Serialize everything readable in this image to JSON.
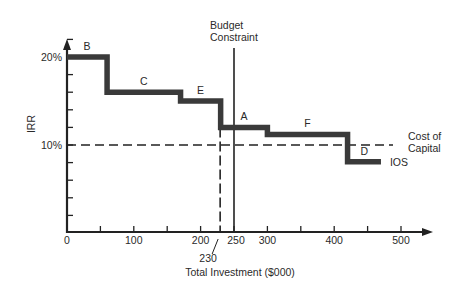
{
  "chart_data": {
    "type": "line",
    "title": "",
    "xlabel": "Total Investment ($000)",
    "ylabel": "IRR",
    "xlim": [
      0,
      550
    ],
    "ylim": [
      0,
      24
    ],
    "x_ticks": [
      0,
      50,
      100,
      150,
      200,
      250,
      300,
      350,
      400,
      450,
      500
    ],
    "x_tick_labels": [
      {
        "value": 0,
        "label": "0"
      },
      {
        "value": 100,
        "label": "100"
      },
      {
        "value": 200,
        "label": "200"
      },
      {
        "value": 250,
        "label": "250"
      },
      {
        "value": 300,
        "label": "300"
      },
      {
        "value": 400,
        "label": "400"
      },
      {
        "value": 500,
        "label": "500"
      }
    ],
    "y_ticks": [
      2,
      4,
      6,
      8,
      10,
      12,
      14,
      16,
      18,
      20,
      22
    ],
    "y_tick_labels": [
      {
        "value": 10,
        "label": "10%"
      },
      {
        "value": 20,
        "label": "20%"
      }
    ],
    "series": [
      {
        "name": "IOS",
        "style": "step",
        "color": "#3a3a3a",
        "steps": [
          {
            "project": "B",
            "x_start": 0,
            "x_end": 60,
            "irr": 20
          },
          {
            "project": "C",
            "x_start": 60,
            "x_end": 170,
            "irr": 16
          },
          {
            "project": "E",
            "x_start": 170,
            "x_end": 230,
            "irr": 15
          },
          {
            "project": "A",
            "x_start": 230,
            "x_end": 300,
            "irr": 12
          },
          {
            "project": "F",
            "x_start": 300,
            "x_end": 420,
            "irr": 11.2
          },
          {
            "project": "D",
            "x_start": 420,
            "x_end": 470,
            "irr": 8.1
          }
        ]
      }
    ],
    "reference_lines": [
      {
        "name": "Cost of Capital",
        "orientation": "horizontal",
        "value": 10,
        "style": "dashed",
        "label_lines": [
          "Cost of",
          "Capital"
        ]
      },
      {
        "name": "Budget Constraint",
        "orientation": "vertical",
        "value": 250,
        "style": "solid",
        "label_lines": [
          "Budget",
          "Constraint"
        ]
      },
      {
        "name": "Marginal investment",
        "orientation": "vertical",
        "value": 230,
        "style": "dashed",
        "label": "230"
      }
    ],
    "grid": false,
    "legend": "none"
  }
}
